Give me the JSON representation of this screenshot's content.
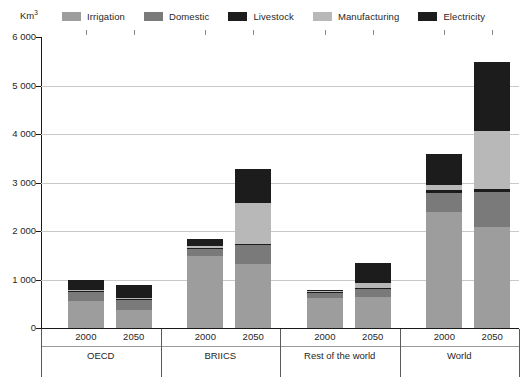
{
  "axis": {
    "unit": "Km",
    "unit_sup": "3",
    "y_ticks": [
      "6 000",
      "5 000",
      "4 000",
      "3 000",
      "2 000",
      "1 000",
      "0"
    ],
    "y_tick_values": [
      6000,
      5000,
      4000,
      3000,
      2000,
      1000,
      0
    ]
  },
  "legend": {
    "items": [
      {
        "label": "Irrigation",
        "color": "#9d9d9d"
      },
      {
        "label": "Domestic",
        "color": "#7a7a7a"
      },
      {
        "label": "Livestock",
        "color": "#1c1c1c"
      },
      {
        "label": "Manufacturing",
        "color": "#b8b8b8"
      },
      {
        "label": "Electricity",
        "color": "#1c1c1c"
      }
    ]
  },
  "groups": [
    {
      "label": "OECD",
      "years": [
        "2000",
        "2050"
      ]
    },
    {
      "label": "BRIICS",
      "years": [
        "2000",
        "2050"
      ]
    },
    {
      "label": "Rest of the world",
      "years": [
        "2000",
        "2050"
      ]
    },
    {
      "label": "World",
      "years": [
        "2000",
        "2050"
      ]
    }
  ],
  "chart_data": {
    "type": "bar",
    "subtype": "stacked-grouped-column",
    "title": "",
    "xlabel": "",
    "ylabel": "Km³",
    "ylim": [
      0,
      6000
    ],
    "ytick_interval": 1000,
    "grid": true,
    "legend_position": "top",
    "categories": [
      "OECD 2000",
      "OECD 2050",
      "BRIICS 2000",
      "BRIICS 2050",
      "Rest of the world 2000",
      "Rest of the world 2050",
      "World 2000",
      "World 2050"
    ],
    "series": [
      {
        "name": "Irrigation",
        "color": "#9d9d9d",
        "values": [
          560,
          370,
          1490,
          1320,
          620,
          640,
          2390,
          2090
        ]
      },
      {
        "name": "Domestic",
        "color": "#7a7a7a",
        "values": [
          190,
          200,
          130,
          390,
          100,
          160,
          400,
          720
        ]
      },
      {
        "name": "Livestock",
        "color": "#1c1c1c",
        "values": [
          20,
          20,
          20,
          30,
          20,
          30,
          50,
          60
        ]
      },
      {
        "name": "Manufacturing",
        "color": "#b8b8b8",
        "values": [
          20,
          20,
          60,
          840,
          20,
          100,
          110,
          1200
        ]
      },
      {
        "name": "Electricity",
        "color": "#1c1c1c",
        "values": [
          190,
          270,
          130,
          700,
          20,
          410,
          630,
          1420
        ]
      }
    ],
    "totals": [
      980,
      880,
      1830,
      3280,
      780,
      1340,
      3580,
      5490
    ]
  }
}
